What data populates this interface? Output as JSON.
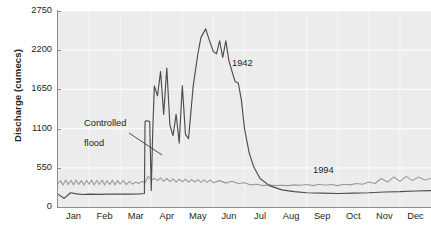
{
  "chart": {
    "type": "line",
    "ylabel": "Discharge (cumecs)",
    "xlabel": "",
    "title": "",
    "background_color": "#ececec",
    "grid": true,
    "legend_position": "inline-annotation"
  },
  "axes": {
    "y_ticks": [
      "0",
      "550",
      "1100",
      "1650",
      "2200",
      "2750"
    ],
    "y_min": 0,
    "y_max": 2750,
    "x_ticks": [
      "Jan",
      "Feb",
      "Mar",
      "Apr",
      "May",
      "Jun",
      "Jul",
      "Aug",
      "Sep",
      "Oct",
      "Nov",
      "Dec"
    ]
  },
  "annotations": {
    "controlled_flood_line1": "Controlled",
    "controlled_flood_line2": "flood",
    "series_1942_label": "1942",
    "series_1994_label": "1994"
  },
  "chart_data": {
    "type": "line",
    "title": "",
    "xlabel": "",
    "ylabel": "Discharge (cumecs)",
    "ylim": [
      0,
      2750
    ],
    "yticks": [
      0,
      550,
      1100,
      1650,
      2200,
      2750
    ],
    "categories": [
      "Jan",
      "Feb",
      "Mar",
      "Apr",
      "May",
      "Jun",
      "Jul",
      "Aug",
      "Sep",
      "Oct",
      "Nov",
      "Dec"
    ],
    "grid": true,
    "annotations": [
      {
        "text": "Controlled flood",
        "points_to_month": "Mar",
        "points_to_value": 1200
      },
      {
        "text": "1942",
        "month": "Jun"
      },
      {
        "text": "1994",
        "month": "Sep"
      }
    ],
    "series": [
      {
        "name": "1942",
        "color": "#4d4d4d",
        "x": [
          0,
          0.2,
          0.4,
          0.6,
          0.8,
          1.0,
          1.3,
          1.6,
          2.0,
          2.3,
          2.6,
          2.78,
          2.8,
          2.84,
          2.9,
          2.95,
          3.0,
          3.05,
          3.1,
          3.2,
          3.3,
          3.4,
          3.5,
          3.6,
          3.7,
          3.8,
          3.9,
          4.0,
          4.1,
          4.2,
          4.35,
          4.5,
          4.6,
          4.75,
          4.9,
          5.0,
          5.1,
          5.2,
          5.3,
          5.4,
          5.5,
          5.6,
          5.7,
          5.8,
          5.9,
          6.0,
          6.15,
          6.3,
          6.5,
          6.8,
          7.2,
          7.6,
          8.0,
          8.5,
          9.0,
          9.5,
          10.0,
          10.5,
          11.0,
          11.5,
          12.0
        ],
        "y": [
          180,
          120,
          200,
          185,
          175,
          180,
          178,
          180,
          180,
          180,
          185,
          190,
          1200,
          1210,
          1205,
          1200,
          230,
          1100,
          1700,
          1560,
          1900,
          1300,
          1950,
          1150,
          1000,
          1300,
          900,
          1700,
          1020,
          960,
          1700,
          2150,
          2380,
          2500,
          2300,
          2180,
          2150,
          2330,
          2100,
          2330,
          2050,
          1900,
          1760,
          1740,
          1500,
          1100,
          760,
          560,
          400,
          300,
          240,
          215,
          200,
          195,
          190,
          195,
          200,
          210,
          215,
          225,
          230
        ]
      },
      {
        "name": "1994",
        "color": "#9a9a9a",
        "x": [
          0,
          0.08,
          0.16,
          0.25,
          0.33,
          0.42,
          0.5,
          0.58,
          0.67,
          0.75,
          0.83,
          0.92,
          1.0,
          1.08,
          1.16,
          1.25,
          1.33,
          1.42,
          1.5,
          1.58,
          1.67,
          1.75,
          1.83,
          1.92,
          2.0,
          2.1,
          2.2,
          2.3,
          2.4,
          2.5,
          2.6,
          2.7,
          2.8,
          2.9,
          3.0,
          3.1,
          3.2,
          3.3,
          3.4,
          3.5,
          3.6,
          3.7,
          3.8,
          3.9,
          4.0,
          4.1,
          4.2,
          4.3,
          4.4,
          4.5,
          4.6,
          4.7,
          4.8,
          4.9,
          5.0,
          5.2,
          5.4,
          5.6,
          5.8,
          6.0,
          6.2,
          6.4,
          6.6,
          6.8,
          7.0,
          7.2,
          7.4,
          7.6,
          7.8,
          8.0,
          8.2,
          8.4,
          8.6,
          8.8,
          9.0,
          9.2,
          9.4,
          9.6,
          9.8,
          10.0,
          10.2,
          10.4,
          10.6,
          10.8,
          11.0,
          11.2,
          11.4,
          11.6,
          11.8,
          12.0
        ],
        "y": [
          330,
          370,
          310,
          380,
          315,
          375,
          310,
          380,
          315,
          370,
          310,
          375,
          320,
          380,
          310,
          375,
          315,
          380,
          310,
          370,
          315,
          375,
          310,
          370,
          320,
          370,
          315,
          360,
          320,
          350,
          330,
          360,
          340,
          430,
          380,
          400,
          370,
          410,
          360,
          400,
          355,
          395,
          350,
          390,
          355,
          390,
          350,
          385,
          350,
          385,
          345,
          380,
          345,
          380,
          340,
          370,
          335,
          360,
          330,
          340,
          310,
          320,
          300,
          310,
          300,
          305,
          300,
          310,
          305,
          315,
          300,
          320,
          305,
          315,
          300,
          320,
          310,
          330,
          320,
          350,
          330,
          400,
          350,
          420,
          360,
          430,
          370,
          420,
          380,
          400
        ]
      }
    ]
  }
}
